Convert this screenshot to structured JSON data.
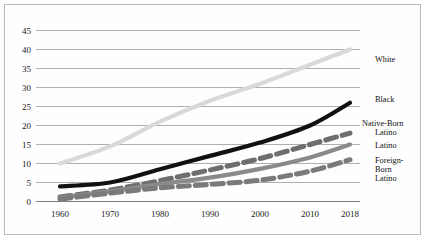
{
  "chart_data": {
    "type": "line",
    "title": "",
    "xlabel": "",
    "ylabel": "",
    "x": [
      1960,
      1970,
      1980,
      1990,
      2000,
      2010,
      2018
    ],
    "xticklabels": [
      "1960",
      "1970",
      "1980",
      "1990",
      "2000",
      "2010",
      "2018"
    ],
    "yticklabels": [
      "0",
      "5",
      "10",
      "15",
      "20",
      "25",
      "30",
      "35",
      "40",
      "45"
    ],
    "ylim": [
      0,
      45
    ],
    "grid": true,
    "legend_position": "inline-right",
    "series": [
      {
        "name": "White",
        "label": "White",
        "color": "#d9d9d9",
        "style": "solid",
        "values": [
          10,
          14.5,
          21,
          26.5,
          31,
          36,
          40
        ]
      },
      {
        "name": "Black",
        "label": "Black",
        "color": "#111111",
        "style": "solid",
        "values": [
          4,
          5,
          8.5,
          12,
          15.5,
          20,
          26
        ]
      },
      {
        "name": "Native-Born Latino",
        "label": "Native-Born Latino",
        "color": "#6e6e6e",
        "style": "dashed",
        "values": [
          1.2,
          3,
          5.5,
          8.3,
          11.3,
          15,
          18
        ]
      },
      {
        "name": "Latino",
        "label": "Latino",
        "color": "#8a8a8a",
        "style": "solid",
        "values": [
          1,
          2.7,
          4.6,
          6.3,
          8.6,
          11.6,
          15
        ]
      },
      {
        "name": "Foreign-Born Latino",
        "label": "Foreign-Born Latino",
        "color": "#7a7a7a",
        "style": "dashed",
        "values": [
          0.6,
          2.2,
          3.6,
          4.5,
          5.6,
          8,
          11
        ]
      }
    ]
  },
  "labels": {
    "white": "White",
    "black": "Black",
    "native_born_line1": "Native-Born",
    "native_born_line2": "Latino",
    "latino": "Latino",
    "foreign_born_line1": "Foreign-",
    "foreign_born_line2": "Born",
    "foreign_born_line3": "Latino"
  },
  "colors": {
    "frame": "#b9b9b9",
    "grid": "#8c8c8c",
    "background": "#ffffff"
  }
}
